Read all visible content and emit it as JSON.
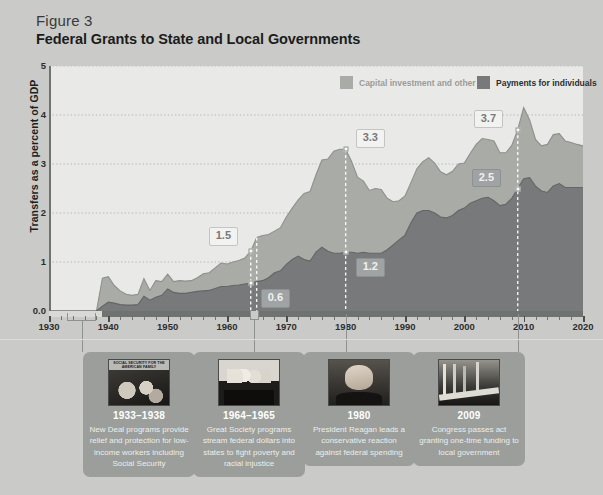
{
  "figure": {
    "label": "Figure 3",
    "title": "Federal Grants to State and Local Governments"
  },
  "legend": [
    {
      "name": "capital-investment",
      "label": "Capital investment and other",
      "color": "#a9aba7",
      "text_color": "#9a9c99"
    },
    {
      "name": "payments-individuals",
      "label": "Payments for individuals",
      "color": "#77797a",
      "text_color": "#2d2e2e"
    }
  ],
  "axes": {
    "y_title": "Transfers as a percent of GDP",
    "y_ticks": [
      "0.0",
      "1",
      "2",
      "3",
      "4",
      "5"
    ],
    "x_ticks": [
      "1930",
      "1940",
      "1950",
      "1960",
      "1970",
      "1980",
      "1990",
      "2000",
      "2010",
      "2020"
    ]
  },
  "callouts": [
    {
      "name": "callout-1964-total",
      "value": "1.5",
      "style": "light",
      "year": 1964
    },
    {
      "name": "callout-1964-payments",
      "value": "0.6",
      "style": "dark",
      "year": 1964
    },
    {
      "name": "callout-1980-total",
      "value": "3.3",
      "style": "light",
      "year": 1980
    },
    {
      "name": "callout-1980-payments",
      "value": "1.2",
      "style": "dark",
      "year": 1980
    },
    {
      "name": "callout-2009-total",
      "value": "3.7",
      "style": "light",
      "year": 2009
    },
    {
      "name": "callout-2009-payments",
      "value": "2.5",
      "style": "dark",
      "year": 2009
    }
  ],
  "cards": [
    {
      "name": "card-new-deal",
      "year": "1933–1938",
      "text": "New Deal programs provide relief and protection for low-income workers including Social Security",
      "photo": "social-security-poster-photo",
      "poster_text": "SOCIAL SECURITY FOR THE AMERICAN FAMILY"
    },
    {
      "name": "card-great-society",
      "year": "1964–1965",
      "text": "Great Society programs stream federal dollars into states to fight poverty and racial injustice",
      "photo": "signing-ceremony-photo"
    },
    {
      "name": "card-reagan",
      "year": "1980",
      "text": "President Reagan leads a conservative reaction against federal spending",
      "photo": "president-reagan-portrait-photo"
    },
    {
      "name": "card-arra",
      "year": "2009",
      "text": "Congress passes act granting one-time funding to local government",
      "photo": "bridge-infrastructure-photo"
    }
  ],
  "chart_data": {
    "type": "area",
    "stacked": true,
    "title": "Federal Grants to State and Local Governments",
    "subtitle": "Figure 3",
    "xlabel": "",
    "ylabel": "Transfers as a percent of GDP",
    "xlim": [
      1930,
      2020
    ],
    "ylim": [
      0,
      5
    ],
    "grid": true,
    "legend_position": "top-right",
    "x": [
      1930,
      1931,
      1932,
      1933,
      1934,
      1935,
      1936,
      1937,
      1938,
      1939,
      1940,
      1941,
      1942,
      1943,
      1944,
      1945,
      1946,
      1947,
      1948,
      1949,
      1950,
      1951,
      1952,
      1953,
      1954,
      1955,
      1956,
      1957,
      1958,
      1959,
      1960,
      1961,
      1962,
      1963,
      1964,
      1965,
      1966,
      1967,
      1968,
      1969,
      1970,
      1971,
      1972,
      1973,
      1974,
      1975,
      1976,
      1977,
      1978,
      1979,
      1980,
      1981,
      1982,
      1983,
      1984,
      1985,
      1986,
      1987,
      1988,
      1989,
      1990,
      1991,
      1992,
      1993,
      1994,
      1995,
      1996,
      1997,
      1998,
      1999,
      2000,
      2001,
      2002,
      2003,
      2004,
      2005,
      2006,
      2007,
      2008,
      2009,
      2010,
      2011,
      2012,
      2013,
      2014,
      2015,
      2016,
      2017,
      2018,
      2019,
      2020
    ],
    "series": [
      {
        "name": "Payments for individuals",
        "color": "#77797a",
        "values": [
          0.0,
          0.0,
          0.0,
          0.0,
          0.0,
          0.0,
          0.0,
          0.0,
          0.0,
          0.1,
          0.18,
          0.16,
          0.13,
          0.12,
          0.12,
          0.13,
          0.3,
          0.22,
          0.28,
          0.32,
          0.45,
          0.38,
          0.36,
          0.36,
          0.38,
          0.4,
          0.41,
          0.42,
          0.46,
          0.5,
          0.5,
          0.52,
          0.53,
          0.55,
          0.57,
          0.6,
          0.62,
          0.68,
          0.78,
          0.82,
          0.95,
          1.05,
          1.12,
          1.05,
          1.02,
          1.2,
          1.3,
          1.22,
          1.18,
          1.18,
          1.2,
          1.2,
          1.18,
          1.2,
          1.18,
          1.18,
          1.18,
          1.25,
          1.35,
          1.45,
          1.55,
          1.8,
          2.0,
          2.05,
          2.05,
          2.0,
          1.92,
          1.9,
          1.95,
          2.05,
          2.1,
          2.2,
          2.25,
          2.3,
          2.32,
          2.25,
          2.15,
          2.18,
          2.3,
          2.5,
          2.7,
          2.72,
          2.55,
          2.45,
          2.42,
          2.55,
          2.6,
          2.52,
          2.52,
          2.52,
          2.52
        ]
      },
      {
        "name": "Capital investment and other",
        "color": "#a9aba7",
        "values": [
          0.0,
          0.0,
          0.0,
          0.0,
          0.0,
          0.0,
          0.0,
          0.0,
          0.0,
          0.57,
          0.52,
          0.36,
          0.28,
          0.22,
          0.2,
          0.21,
          0.36,
          0.2,
          0.34,
          0.28,
          0.3,
          0.22,
          0.26,
          0.25,
          0.24,
          0.28,
          0.35,
          0.36,
          0.42,
          0.48,
          0.46,
          0.48,
          0.5,
          0.53,
          0.65,
          0.9,
          0.92,
          0.88,
          0.85,
          0.88,
          0.97,
          1.05,
          1.15,
          1.35,
          1.42,
          1.58,
          1.78,
          1.88,
          2.08,
          2.12,
          2.1,
          1.85,
          1.55,
          1.45,
          1.28,
          1.32,
          1.3,
          1.05,
          0.88,
          0.8,
          0.8,
          0.82,
          0.9,
          1.0,
          1.08,
          1.02,
          0.92,
          0.88,
          0.9,
          0.95,
          0.92,
          1.02,
          1.15,
          1.22,
          1.18,
          1.22,
          1.08,
          1.05,
          1.08,
          1.2,
          1.45,
          1.18,
          0.95,
          0.92,
          0.98,
          1.05,
          1.02,
          0.95,
          0.92,
          0.88,
          0.85
        ]
      }
    ],
    "annotations": [
      {
        "year": 1964,
        "label": "1.5",
        "series": "total"
      },
      {
        "year": 1964,
        "label": "0.6",
        "series": "Payments for individuals"
      },
      {
        "year": 1980,
        "label": "3.3",
        "series": "total"
      },
      {
        "year": 1980,
        "label": "1.2",
        "series": "Payments for individuals"
      },
      {
        "year": 2009,
        "label": "3.7",
        "series": "total"
      },
      {
        "year": 2009,
        "label": "2.5",
        "series": "Payments for individuals"
      }
    ]
  }
}
